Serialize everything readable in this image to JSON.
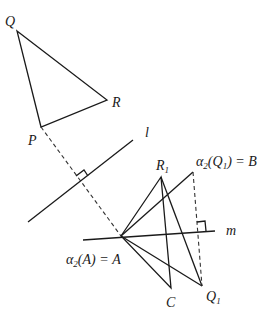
{
  "diagram": {
    "type": "geometric-transformation",
    "points": {
      "Q": {
        "label": "Q",
        "x": 17,
        "y": 31
      },
      "R": {
        "label": "R",
        "x": 107,
        "y": 100
      },
      "P": {
        "label": "P",
        "x": 41,
        "y": 127
      },
      "A": {
        "label": "α₂(A) = A",
        "x": 121,
        "y": 236
      },
      "R1": {
        "label": "R",
        "sub": "1",
        "x": 161,
        "y": 177
      },
      "B": {
        "label": "α₂(Q₁) = B",
        "x": 193,
        "y": 172
      },
      "C": {
        "label": "C",
        "x": 171,
        "y": 288
      },
      "Q1": {
        "label": "Q",
        "sub": "1",
        "x": 202,
        "y": 286
      }
    },
    "lines": {
      "l": {
        "label": "l"
      },
      "m": {
        "label": "m"
      }
    },
    "labels": {
      "Q": "Q",
      "R": "R",
      "P": "P",
      "l": "l",
      "m": "m",
      "R1_main": "R",
      "R1_sub": "1",
      "B_alpha": "α",
      "B_alpha_sub": "2",
      "B_open": "(Q",
      "B_q_sub": "1",
      "B_close": ") = B",
      "A_alpha": "α",
      "A_alpha_sub": "2",
      "A_rest": "(A) = A",
      "C": "C",
      "Q1_main": "Q",
      "Q1_sub": "1"
    }
  }
}
